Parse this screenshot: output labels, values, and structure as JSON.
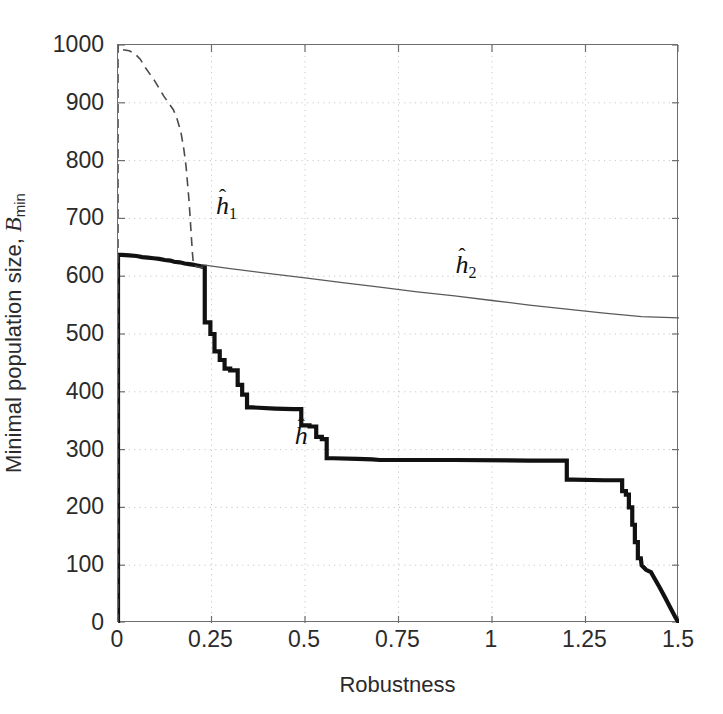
{
  "figure": {
    "background": "#ffffff",
    "axis_color": "#6e6e6e",
    "grid_color": "#c8c8c8",
    "curve_color": "#111111"
  },
  "axes": {
    "xlabel": "Robustness",
    "ylabel_prefix": "Minimal population size, ",
    "ylabel_symbol": "B",
    "ylabel_sub": "min",
    "xticks": [
      "0",
      "0.25",
      "0.5",
      "0.75",
      "1",
      "1.25",
      "1.5"
    ],
    "xtick_values": [
      0,
      0.25,
      0.5,
      0.75,
      1,
      1.25,
      1.5
    ],
    "yticks": [
      "0",
      "100",
      "200",
      "300",
      "400",
      "500",
      "600",
      "700",
      "800",
      "900",
      "1000"
    ],
    "ytick_values": [
      0,
      100,
      200,
      300,
      400,
      500,
      600,
      700,
      800,
      900,
      1000
    ],
    "xlim": [
      0,
      1.5
    ],
    "ylim": [
      0,
      1000
    ],
    "grid": "dotted",
    "ticks_all_sides": true
  },
  "annotations": [
    {
      "name": "h1-label",
      "text": "h",
      "sub": "1",
      "hat": "̂",
      "x": 0.265,
      "y": 742
    },
    {
      "name": "h2-label",
      "text": "h",
      "sub": "2",
      "hat": "̂",
      "x": 0.905,
      "y": 640
    },
    {
      "name": "h-label",
      "text": "h",
      "sub": "",
      "hat": "̂",
      "x": 0.475,
      "y": 345
    }
  ],
  "chart_data": {
    "type": "line",
    "title": "",
    "xlabel": "Robustness",
    "ylabel": "Minimal population size, B_min",
    "xlim": [
      0,
      1.5
    ],
    "ylim": [
      0,
      1000
    ],
    "grid": true,
    "legend": "inline-annotations",
    "series": [
      {
        "name": "h_hat",
        "label": "ĥ",
        "style": "solid-thick",
        "width": 4.2,
        "color": "#111111",
        "points": [
          [
            0.0,
            0
          ],
          [
            0.0,
            637
          ],
          [
            0.01,
            637
          ],
          [
            0.03,
            636
          ],
          [
            0.05,
            635
          ],
          [
            0.065,
            633
          ],
          [
            0.08,
            632
          ],
          [
            0.095,
            631
          ],
          [
            0.11,
            630
          ],
          [
            0.125,
            628
          ],
          [
            0.14,
            627
          ],
          [
            0.15,
            625
          ],
          [
            0.165,
            624
          ],
          [
            0.178,
            622
          ],
          [
            0.19,
            621
          ],
          [
            0.2,
            620
          ],
          [
            0.208,
            619
          ],
          [
            0.215,
            618
          ],
          [
            0.222,
            617
          ],
          [
            0.228,
            616
          ],
          [
            0.232,
            616
          ],
          [
            0.232,
            520
          ],
          [
            0.247,
            520
          ],
          [
            0.247,
            500
          ],
          [
            0.258,
            500
          ],
          [
            0.258,
            470
          ],
          [
            0.272,
            470
          ],
          [
            0.272,
            455
          ],
          [
            0.285,
            455
          ],
          [
            0.285,
            440
          ],
          [
            0.3,
            440
          ],
          [
            0.3,
            437
          ],
          [
            0.32,
            437
          ],
          [
            0.32,
            412
          ],
          [
            0.332,
            412
          ],
          [
            0.332,
            395
          ],
          [
            0.345,
            395
          ],
          [
            0.345,
            373
          ],
          [
            0.36,
            373
          ],
          [
            0.42,
            371
          ],
          [
            0.47,
            370
          ],
          [
            0.49,
            370
          ],
          [
            0.49,
            342
          ],
          [
            0.512,
            342
          ],
          [
            0.512,
            340
          ],
          [
            0.53,
            340
          ],
          [
            0.53,
            322
          ],
          [
            0.545,
            322
          ],
          [
            0.545,
            318
          ],
          [
            0.558,
            318
          ],
          [
            0.558,
            285
          ],
          [
            0.575,
            285
          ],
          [
            0.64,
            284
          ],
          [
            0.68,
            283
          ],
          [
            0.7,
            282
          ],
          [
            0.9,
            282
          ],
          [
            1.1,
            281
          ],
          [
            1.19,
            281
          ],
          [
            1.2,
            281
          ],
          [
            1.2,
            248
          ],
          [
            1.215,
            248
          ],
          [
            1.3,
            247
          ],
          [
            1.34,
            247
          ],
          [
            1.348,
            247
          ],
          [
            1.348,
            228
          ],
          [
            1.358,
            228
          ],
          [
            1.358,
            222
          ],
          [
            1.366,
            222
          ],
          [
            1.366,
            200
          ],
          [
            1.375,
            200
          ],
          [
            1.375,
            170
          ],
          [
            1.382,
            170
          ],
          [
            1.382,
            140
          ],
          [
            1.39,
            140
          ],
          [
            1.39,
            112
          ],
          [
            1.398,
            112
          ],
          [
            1.4,
            100
          ],
          [
            1.412,
            92
          ],
          [
            1.425,
            88
          ],
          [
            1.432,
            80
          ],
          [
            1.448,
            62
          ],
          [
            1.462,
            45
          ],
          [
            1.478,
            25
          ],
          [
            1.492,
            8
          ],
          [
            1.5,
            0
          ]
        ]
      },
      {
        "name": "h1_hat",
        "label": "ĥ1",
        "style": "dashed",
        "width": 1.6,
        "color": "#4a4a4a",
        "points": [
          [
            0.0,
            0
          ],
          [
            0.0,
            1000
          ],
          [
            0.012,
            992
          ],
          [
            0.03,
            990
          ],
          [
            0.045,
            985
          ],
          [
            0.06,
            975
          ],
          [
            0.072,
            962
          ],
          [
            0.085,
            950
          ],
          [
            0.098,
            938
          ],
          [
            0.11,
            925
          ],
          [
            0.122,
            912
          ],
          [
            0.135,
            900
          ],
          [
            0.148,
            888
          ],
          [
            0.158,
            872
          ],
          [
            0.168,
            850
          ],
          [
            0.176,
            820
          ],
          [
            0.182,
            790
          ],
          [
            0.186,
            760
          ],
          [
            0.19,
            730
          ],
          [
            0.193,
            700
          ],
          [
            0.196,
            670
          ],
          [
            0.199,
            640
          ],
          [
            0.202,
            618
          ],
          [
            0.215,
            616
          ],
          [
            0.228,
            615
          ]
        ]
      },
      {
        "name": "h2_hat",
        "label": "ĥ2",
        "style": "solid-thin",
        "width": 1.3,
        "color": "#5a5a5a",
        "points": [
          [
            0.222,
            620
          ],
          [
            0.3,
            613
          ],
          [
            0.4,
            605
          ],
          [
            0.5,
            597
          ],
          [
            0.6,
            589
          ],
          [
            0.7,
            581
          ],
          [
            0.8,
            573
          ],
          [
            0.9,
            566
          ],
          [
            1.0,
            558
          ],
          [
            1.1,
            550
          ],
          [
            1.2,
            543
          ],
          [
            1.3,
            536
          ],
          [
            1.4,
            530
          ],
          [
            1.5,
            528
          ]
        ]
      }
    ]
  }
}
